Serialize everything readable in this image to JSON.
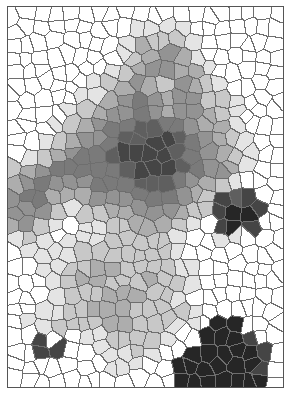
{
  "image": {
    "description": "Grayscale stained-glass (Voronoi) mosaic with dark clusters on a white field",
    "width": 275,
    "height": 380,
    "cols": 20,
    "rows": 27,
    "edge_color": "#6e6e6e",
    "edge_width": 1.4,
    "seed": 7,
    "gray_map": [
      "00000000000000000000",
      "00000000011110000000",
      "00000000132221000000",
      "00000000123431000000",
      "00000001234433100000",
      "00000012343243210000",
      "00000113454344221000",
      "00001234454344321000",
      "00012345566554331000",
      "00123445667765432100",
      "01234556777765432100",
      "23455555677765443100",
      "34544455566654321000",
      "45533344455543276700",
      "44421223344432278870",
      "34210112233321078700",
      "12101112222210011000",
      "01111222222210000000",
      "00112233222211000000",
      "00012332223221000000",
      "00012223332210000000",
      "00112233322221000000",
      "01122223322211088000",
      "00700112222100888700",
      "00770011121008888870",
      "00000001110088888870",
      "00000000000088888880"
    ],
    "gray_levels": [
      "#ffffff",
      "#e4e4e4",
      "#c8c8c8",
      "#adadad",
      "#939393",
      "#7a7a7a",
      "#5f5f5f",
      "#454545",
      "#262626"
    ]
  }
}
